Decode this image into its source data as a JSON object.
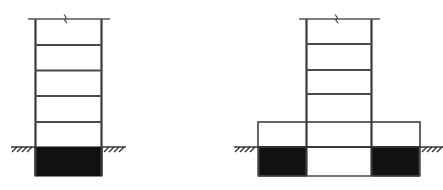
{
  "figure": {
    "kind": "structural-elevation-diagram",
    "background_color": "#ffffff",
    "line_color": "#2b2b2b",
    "fill_color_basement": "#111111",
    "fill_color_void": "#ffffff",
    "width_px": 443,
    "height_px": 190
  },
  "structures": [
    {
      "id": "left-structure",
      "label": "Uniform tower on embedded basement",
      "tower": {
        "left_x": 35,
        "right_x": 102,
        "top_y": 19,
        "base_y": 147,
        "column_count": 2,
        "story_count": 5,
        "floor_line_y": [
          45,
          70,
          96,
          122
        ],
        "cap_line": {
          "y": 19,
          "left_x": 28,
          "right_x": 110,
          "overhang_px": 7
        },
        "break_symbol": {
          "x": 66,
          "y": 19,
          "type": "break-squiggle"
        }
      },
      "ground": {
        "y": 147,
        "hatch_left_start_x": 11,
        "hatch_left_end_x": 35,
        "hatch_right_start_x": 102,
        "hatch_right_end_x": 126,
        "hatch_tick_count": 4,
        "hatch_angle_deg": 45
      },
      "basement": {
        "left_x": 35,
        "right_x": 102,
        "top_y": 147,
        "bottom_y": 176,
        "fill": "solid-black",
        "bay_count": 1
      }
    },
    {
      "id": "right-structure",
      "label": "Tower on wide podium with embedded side basements",
      "tower": {
        "left_x": 306,
        "right_x": 372,
        "top_y": 19,
        "base_y": 122,
        "column_count": 2,
        "story_count": 4,
        "floor_line_y": [
          44,
          70,
          94
        ],
        "cap_line": {
          "y": 19,
          "left_x": 299,
          "right_x": 380,
          "overhang_px": 7
        },
        "break_symbol": {
          "x": 337,
          "y": 19,
          "type": "break-squiggle"
        }
      },
      "podium": {
        "left_x": 258,
        "right_x": 420,
        "top_y": 122,
        "base_y": 147,
        "bay_count": 3,
        "bay_divider_x": [
          306,
          372
        ]
      },
      "ground": {
        "y": 147,
        "hatch_left_start_x": 234,
        "hatch_left_end_x": 258,
        "hatch_right_start_x": 420,
        "hatch_right_end_x": 444,
        "hatch_tick_count": 4,
        "hatch_angle_deg": 45
      },
      "basement": {
        "top_y": 147,
        "bottom_y": 176,
        "bays": [
          {
            "id": "left-bay",
            "left_x": 258,
            "right_x": 306,
            "fill": "solid-black"
          },
          {
            "id": "center-bay",
            "left_x": 306,
            "right_x": 372,
            "fill": "white-void"
          },
          {
            "id": "right-bay",
            "left_x": 372,
            "right_x": 420,
            "fill": "solid-black"
          }
        ]
      }
    }
  ]
}
